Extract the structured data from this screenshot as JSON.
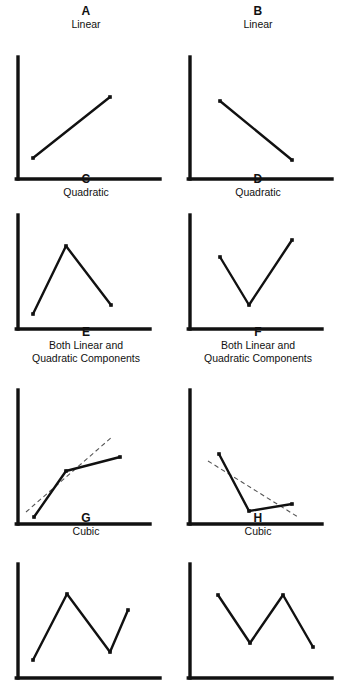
{
  "figure": {
    "background": "#ffffff",
    "ink": "#111111",
    "dash_color": "#555555"
  },
  "panels": [
    {
      "letter": "A",
      "caption": "Linear",
      "axes": {
        "x0": 18,
        "y0": 148,
        "x1": 160,
        "ytop": 26
      },
      "points": [
        [
          33,
          127
        ],
        [
          110,
          66
        ]
      ],
      "trend": null
    },
    {
      "letter": "B",
      "caption": "Linear",
      "axes": {
        "x0": 18,
        "y0": 148,
        "x1": 160,
        "ytop": 26
      },
      "points": [
        [
          48,
          70
        ],
        [
          120,
          129
        ]
      ],
      "trend": null
    },
    {
      "letter": "C",
      "caption": "Quadratic",
      "axes": {
        "x0": 18,
        "y0": 130,
        "x1": 150,
        "ytop": 16
      },
      "points": [
        [
          33,
          115
        ],
        [
          66,
          47
        ],
        [
          111,
          106
        ]
      ],
      "trend": null
    },
    {
      "letter": "D",
      "caption": "Quadratic",
      "axes": {
        "x0": 18,
        "y0": 130,
        "x1": 150,
        "ytop": 16
      },
      "points": [
        [
          48,
          58
        ],
        [
          77,
          106
        ],
        [
          120,
          41
        ]
      ],
      "trend": null
    },
    {
      "letter": "E",
      "caption": "Both Linear and\nQuadratic Components",
      "axes": {
        "x0": 18,
        "y0": 160,
        "x1": 150,
        "ytop": 26
      },
      "points": [
        [
          34,
          153
        ],
        [
          66,
          107
        ],
        [
          120,
          93
        ]
      ],
      "trend": [
        [
          26,
          148
        ],
        [
          112,
          73
        ]
      ]
    },
    {
      "letter": "F",
      "caption": "Both Linear and\nQuadratic Components",
      "axes": {
        "x0": 18,
        "y0": 160,
        "x1": 150,
        "ytop": 26
      },
      "points": [
        [
          47,
          90
        ],
        [
          77,
          147
        ],
        [
          120,
          140
        ]
      ],
      "trend": [
        [
          36,
          97
        ],
        [
          126,
          153
        ]
      ]
    },
    {
      "letter": "G",
      "caption": "Cubic",
      "axes": {
        "x0": 18,
        "y0": 140,
        "x1": 160,
        "ytop": 26
      },
      "points": [
        [
          33,
          122
        ],
        [
          67,
          56
        ],
        [
          110,
          114
        ],
        [
          128,
          72
        ]
      ],
      "trend": null
    },
    {
      "letter": "H",
      "caption": "Cubic",
      "axes": {
        "x0": 18,
        "y0": 140,
        "x1": 160,
        "ytop": 26
      },
      "points": [
        [
          46,
          57
        ],
        [
          78,
          105
        ],
        [
          111,
          57
        ],
        [
          141,
          109
        ]
      ],
      "trend": null
    }
  ],
  "chart_data": {
    "type": "line",
    "xlabel": "",
    "ylabel": "",
    "grid": false,
    "legend": "none",
    "panels": [
      {
        "id": "A",
        "label": "Linear",
        "trend_type": "linear",
        "direction": "increasing",
        "x": [
          1,
          2
        ],
        "y": [
          1,
          4
        ],
        "regression_line_shown": false
      },
      {
        "id": "B",
        "label": "Linear",
        "trend_type": "linear",
        "direction": "decreasing",
        "x": [
          1,
          2
        ],
        "y": [
          4,
          1
        ],
        "regression_line_shown": false
      },
      {
        "id": "C",
        "label": "Quadratic",
        "trend_type": "quadratic",
        "direction": "inverted-u",
        "x": [
          1,
          2,
          3
        ],
        "y": [
          1,
          4,
          1.6
        ],
        "regression_line_shown": false
      },
      {
        "id": "D",
        "label": "Quadratic",
        "trend_type": "quadratic",
        "direction": "u-shaped",
        "x": [
          1,
          2,
          3
        ],
        "y": [
          3,
          1,
          4
        ],
        "regression_line_shown": false
      },
      {
        "id": "E",
        "label": "Both Linear and Quadratic Components",
        "trend_type": "linear+quadratic",
        "direction": "increasing-decelerating",
        "x": [
          1,
          2,
          3
        ],
        "y": [
          1,
          3.2,
          3.8
        ],
        "regression_line_shown": true
      },
      {
        "id": "F",
        "label": "Both Linear and Quadratic Components",
        "trend_type": "linear+quadratic",
        "direction": "decreasing-decelerating",
        "x": [
          1,
          2,
          3
        ],
        "y": [
          4,
          1,
          1.3
        ],
        "regression_line_shown": true
      },
      {
        "id": "G",
        "label": "Cubic",
        "trend_type": "cubic",
        "direction": "up-down-up",
        "x": [
          1,
          2,
          3,
          4
        ],
        "y": [
          1,
          4,
          1.4,
          3
        ],
        "regression_line_shown": false
      },
      {
        "id": "H",
        "label": "Cubic",
        "trend_type": "cubic",
        "direction": "down-up-down",
        "x": [
          1,
          2,
          3,
          4
        ],
        "y": [
          4,
          1.7,
          4,
          1.3
        ],
        "regression_line_shown": false
      }
    ]
  }
}
